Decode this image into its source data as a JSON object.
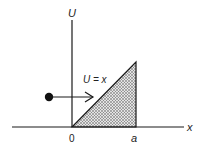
{
  "labels": {
    "y_axis": "U",
    "x_axis": "x",
    "origin": "0",
    "x_mark": "a",
    "potential": "U = x"
  },
  "colors": {
    "line": "#1a1a1a",
    "hatch": "#555555",
    "fill": "#d8d8d8",
    "background": "#ffffff"
  },
  "geometry": {
    "triangle": [
      [
        0,
        0
      ],
      [
        "a",
        "a"
      ],
      [
        "a",
        0
      ]
    ],
    "particle_direction": "right"
  }
}
